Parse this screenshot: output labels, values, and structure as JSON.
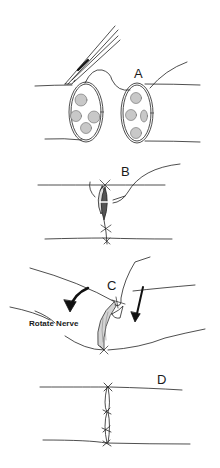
{
  "diagram": {
    "type": "surgical-illustration",
    "panels": [
      {
        "id": "A",
        "label": "A",
        "description": "Two nerve stumps in cross-section showing fascicles; forceps placing first epineurial suture"
      },
      {
        "id": "B",
        "label": "B",
        "description": "Nerve ends approximated with sutures at top and bottom; traction sutures lateral"
      },
      {
        "id": "C",
        "label": "C",
        "description": "Nerve rotated using traction sutures to expose posterior aspect",
        "annotation": "Rotate Nerve"
      },
      {
        "id": "D",
        "label": "D",
        "description": "Completed repair with three sutures along coaptation line"
      }
    ],
    "colors": {
      "ink": "#1a1a1a",
      "background": "#ffffff",
      "fascicle": "#bdbdbd"
    }
  }
}
